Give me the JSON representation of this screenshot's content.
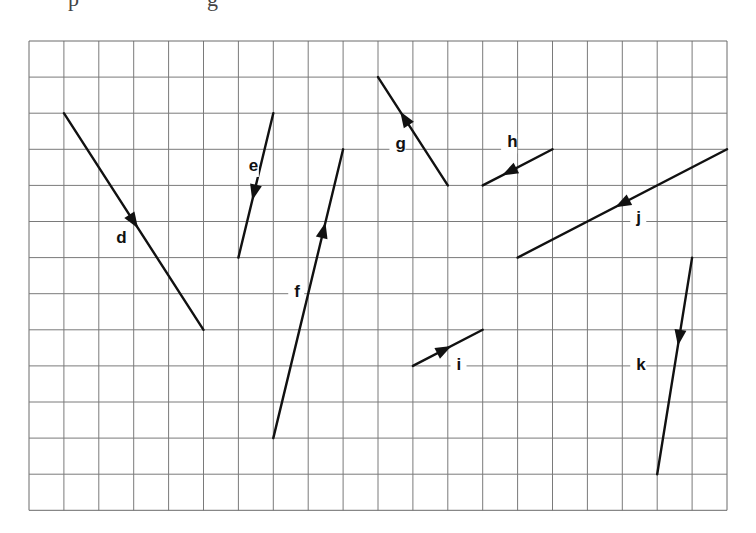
{
  "header_fragment": {
    "left_text": "p",
    "middle_text": "g"
  },
  "grid": {
    "origin_x": 29,
    "origin_y": 41,
    "cols": 20,
    "rows": 13,
    "cell_w": 34.9,
    "cell_h": 36.1,
    "line_color": "#7a7a7a",
    "border_color": "#6a6a6a"
  },
  "vector_color": "#111111",
  "vectors": [
    {
      "name": "d",
      "start": [
        1,
        2
      ],
      "end": [
        5,
        8
      ],
      "arrow_t": 0.5,
      "label": "d",
      "label_pos": [
        2.5,
        5.6
      ]
    },
    {
      "name": "e",
      "start": [
        7,
        2
      ],
      "end": [
        6,
        6
      ],
      "arrow_t": 0.55,
      "label": "e",
      "label_pos": [
        6.3,
        3.6
      ]
    },
    {
      "name": "f",
      "start": [
        7,
        11
      ],
      "end": [
        9,
        3
      ],
      "arrow_t": 0.72,
      "label": "f",
      "label_pos": [
        7.6,
        7.1
      ]
    },
    {
      "name": "g",
      "start": [
        12,
        4
      ],
      "end": [
        10,
        1
      ],
      "arrow_t": 0.62,
      "label": "g",
      "label_pos": [
        10.5,
        3.0
      ]
    },
    {
      "name": "h",
      "start": [
        15,
        3
      ],
      "end": [
        13,
        4
      ],
      "arrow_t": 0.62,
      "label": "h",
      "label_pos": [
        13.7,
        2.95
      ]
    },
    {
      "name": "i",
      "start": [
        11,
        9
      ],
      "end": [
        13,
        8
      ],
      "arrow_t": 0.45,
      "label": "i",
      "label_pos": [
        12.25,
        9.1
      ]
    },
    {
      "name": "j",
      "start": [
        20,
        3
      ],
      "end": [
        14,
        6
      ],
      "arrow_t": 0.5,
      "label": "j",
      "label_pos": [
        17.4,
        5.05
      ]
    },
    {
      "name": "k",
      "start": [
        19,
        6
      ],
      "end": [
        18,
        12
      ],
      "arrow_t": 0.37,
      "label": "k",
      "label_pos": [
        17.4,
        9.1
      ]
    }
  ]
}
